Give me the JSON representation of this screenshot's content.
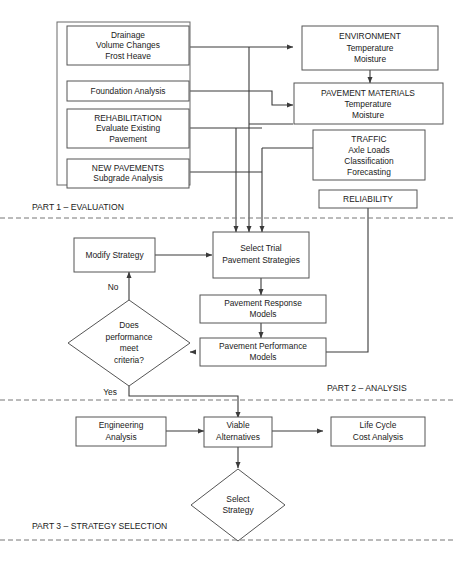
{
  "diagram": {
    "colors": {
      "background": "#ffffff",
      "box_stroke": "#555555",
      "connector": "#3a3a3a",
      "divider": "#777777",
      "text": "#1a1a1a"
    },
    "part1": {
      "label": "PART 1 – EVALUATION",
      "inputs": [
        {
          "lines": [
            "Drainage",
            "Volume Changes",
            "Frost Heave"
          ]
        },
        {
          "lines": [
            "Foundation Analysis"
          ]
        },
        {
          "lines": [
            "REHABILITATION",
            "Evaluate Existing",
            "Pavement"
          ]
        },
        {
          "lines": [
            "NEW PAVEMENTS",
            "Subgrade Analysis"
          ]
        }
      ],
      "factors": [
        {
          "lines": [
            "ENVIRONMENT",
            "Temperature",
            "Moisture"
          ]
        },
        {
          "lines": [
            "PAVEMENT MATERIALS",
            "Temperature",
            "Moisture"
          ]
        },
        {
          "lines": [
            "TRAFFIC",
            "Axle Loads",
            "Classification",
            "Forecasting"
          ]
        },
        {
          "lines": [
            "RELIABILITY"
          ]
        }
      ]
    },
    "part2": {
      "label": "PART 2 – ANALYSIS",
      "nodes": [
        {
          "lines": [
            "Modify Strategy"
          ]
        },
        {
          "lines": [
            "Select Trial",
            "Pavement Strategies"
          ]
        },
        {
          "lines": [
            "Pavement Response",
            "Models"
          ]
        },
        {
          "lines": [
            "Pavement Performance",
            "Models"
          ]
        }
      ],
      "decision": {
        "lines": [
          "Does",
          "performance",
          "meet",
          "criteria?"
        ]
      },
      "edge_labels": {
        "no": "No",
        "yes": "Yes"
      }
    },
    "part3": {
      "label": "PART 3 – STRATEGY SELECTION",
      "nodes": [
        {
          "lines": [
            "Engineering",
            "Analysis"
          ]
        },
        {
          "lines": [
            "Viable",
            "Alternatives"
          ]
        },
        {
          "lines": [
            "Life Cycle",
            "Cost Analysis"
          ]
        }
      ],
      "decision": {
        "lines": [
          "Select",
          "Strategy"
        ]
      }
    }
  }
}
